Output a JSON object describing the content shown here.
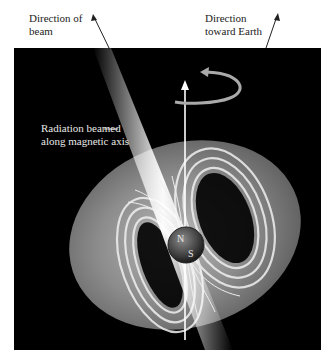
{
  "figure": {
    "labels": {
      "beam_direction": [
        "Direction of",
        "beam"
      ],
      "earth_direction": [
        "Direction",
        "toward Earth"
      ],
      "radiation": [
        "Radiation beamed",
        "along magnetic axis"
      ],
      "north_pole": "N",
      "south_pole": "S"
    },
    "colors": {
      "background": "#ffffff",
      "panel": "#000000",
      "beam": "#ffffff",
      "magnetosphere": "#8a8a8a",
      "star": "#555555",
      "label_text": "#222222",
      "panel_text": "#e8e8e8"
    }
  }
}
